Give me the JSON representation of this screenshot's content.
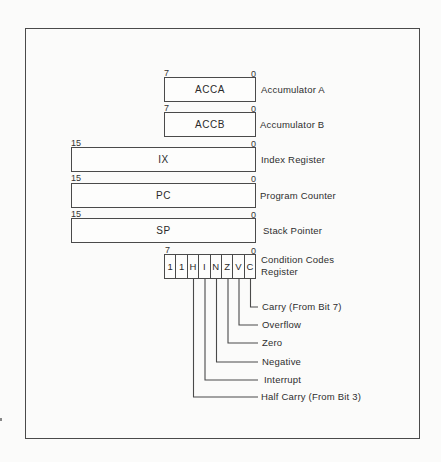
{
  "diagram": {
    "registers": [
      {
        "name": "ACCA",
        "description": "Accumulator A",
        "high_bit": "7",
        "low_bit": "0"
      },
      {
        "name": "ACCB",
        "description": "Accumulator B",
        "high_bit": "7",
        "low_bit": "0"
      },
      {
        "name": "IX",
        "description": "Index Register",
        "high_bit": "15",
        "low_bit": "0"
      },
      {
        "name": "PC",
        "description": "Program Counter",
        "high_bit": "15",
        "low_bit": "0"
      },
      {
        "name": "SP",
        "description": "Stack Pointer",
        "high_bit": "15",
        "low_bit": "0"
      }
    ],
    "ccr": {
      "description_line1": "Condition Codes",
      "description_line2": "Register",
      "high_bit": "7",
      "low_bit": "0",
      "bits": [
        "1",
        "1",
        "H",
        "I",
        "N",
        "Z",
        "V",
        "C"
      ],
      "flags": [
        {
          "bit": "C",
          "label": "Carry (From Bit 7)"
        },
        {
          "bit": "V",
          "label": "Overflow"
        },
        {
          "bit": "Z",
          "label": "Zero"
        },
        {
          "bit": "N",
          "label": "Negative"
        },
        {
          "bit": "I",
          "label": "Interrupt"
        },
        {
          "bit": "H",
          "label": "Half Carry (From Bit 3)"
        }
      ]
    }
  }
}
